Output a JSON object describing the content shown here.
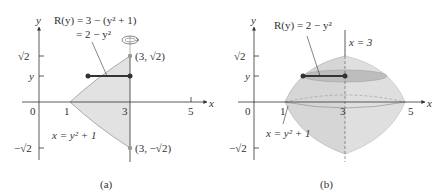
{
  "figure_a": {
    "caption": "(a)",
    "axis_x": "x",
    "axis_y": "y",
    "radius_label_line1": "R(y) = 3 − (y² + 1)",
    "radius_label_line2": "= 2 − y²",
    "tick_sqrt2": "√2",
    "tick_y": "y",
    "tick_neg_sqrt2": "−√2",
    "x_tick_0": "0",
    "x_tick_1": "1",
    "x_tick_3": "3",
    "x_tick_5": "5",
    "curve_label": "x = y² + 1",
    "point_top": "(3, √2)",
    "point_bottom": "(3, −√2)"
  },
  "figure_b": {
    "caption": "(b)",
    "axis_x": "x",
    "axis_y": "y",
    "radius_label": "R(y) = 2 − y²",
    "axis_of_rotation_label": "x = 3",
    "tick_sqrt2": "√2",
    "tick_y": "y",
    "tick_neg_sqrt2": "−√2",
    "x_tick_0": "0",
    "x_tick_1": "1",
    "x_tick_3": "3",
    "x_tick_5": "5",
    "curve_label": "x = y² + 1"
  },
  "colors": {
    "region_fill": "#e2e2e2",
    "solid_fill": "#d6d6d6",
    "line": "#333333",
    "point": "#333333",
    "point_gray": "#999999"
  }
}
